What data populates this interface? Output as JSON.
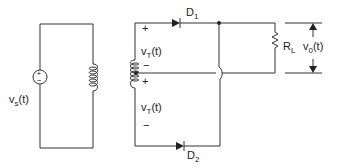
{
  "diagram": {
    "source": {
      "label": "v",
      "sub": "s",
      "suffix": "(t)",
      "plus": "+",
      "minus": "−"
    },
    "secondary_top": {
      "label": "v",
      "sub": "T",
      "suffix": "(t)",
      "plus": "+",
      "minus": "−"
    },
    "secondary_bottom": {
      "label": "v",
      "sub": "T",
      "suffix": "(t)",
      "plus": "+",
      "minus": "−"
    },
    "diode1": {
      "label": "D",
      "sub": "1"
    },
    "diode2": {
      "label": "D",
      "sub": "2"
    },
    "load": {
      "label": "R",
      "sub": "L"
    },
    "output": {
      "label": "v",
      "sub": "0",
      "suffix": "(t)"
    }
  }
}
